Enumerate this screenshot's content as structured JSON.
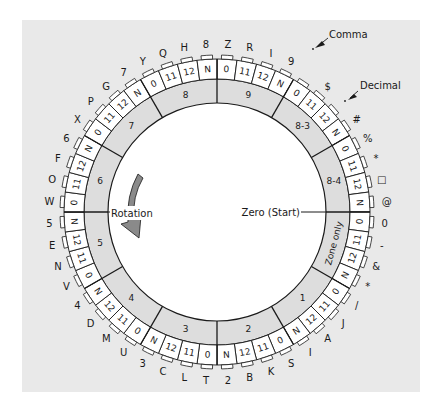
{
  "diagram": {
    "rotation_label": "Rotation",
    "zero_label": "Zero (Start)",
    "annotations": {
      "comma": "Comma",
      "decimal": "Decimal"
    },
    "colors": {
      "background": "#e9e9e9",
      "ring_fill": "#ffffff",
      "annulus_fill": "#dddddd",
      "stroke": "#1a1a1a",
      "arrow": "#8a8a8a"
    },
    "sectors": [
      {
        "label": "9"
      },
      {
        "label": "8-3"
      },
      {
        "label": "8-4"
      },
      {
        "label": "Zone only"
      },
      {
        "label": "1"
      },
      {
        "label": "2"
      },
      {
        "label": "3"
      },
      {
        "label": "4"
      },
      {
        "label": "5"
      },
      {
        "label": "6"
      },
      {
        "label": "7"
      },
      {
        "label": "8"
      }
    ],
    "cells": [
      {
        "code": "0",
        "char": "Z"
      },
      {
        "code": "11",
        "char": "R"
      },
      {
        "code": "12",
        "char": "I"
      },
      {
        "code": "N",
        "char": "9"
      },
      {
        "code": "0",
        "char": ","
      },
      {
        "code": "11",
        "char": "$"
      },
      {
        "code": "12",
        "char": "."
      },
      {
        "code": "N",
        "char": "#"
      },
      {
        "code": "0",
        "char": "%"
      },
      {
        "code": "11",
        "char": "*"
      },
      {
        "code": "12",
        "char": "□"
      },
      {
        "code": "N",
        "char": "@"
      },
      {
        "code": "0",
        "char": "0"
      },
      {
        "code": "11",
        "char": "-"
      },
      {
        "code": "12",
        "char": "&"
      },
      {
        "code": "N",
        "char": "*"
      },
      {
        "code": "0",
        "char": "/"
      },
      {
        "code": "11",
        "char": "J"
      },
      {
        "code": "12",
        "char": "A"
      },
      {
        "code": "N",
        "char": "I"
      },
      {
        "code": "0",
        "char": "S"
      },
      {
        "code": "11",
        "char": "K"
      },
      {
        "code": "12",
        "char": "B"
      },
      {
        "code": "N",
        "char": "2"
      },
      {
        "code": "0",
        "char": "T"
      },
      {
        "code": "11",
        "char": "L"
      },
      {
        "code": "12",
        "char": "C"
      },
      {
        "code": "N",
        "char": "3"
      },
      {
        "code": "0",
        "char": "U"
      },
      {
        "code": "11",
        "char": "M"
      },
      {
        "code": "12",
        "char": "D"
      },
      {
        "code": "N",
        "char": "4"
      },
      {
        "code": "0",
        "char": "V"
      },
      {
        "code": "11",
        "char": "N"
      },
      {
        "code": "12",
        "char": "E"
      },
      {
        "code": "N",
        "char": "5"
      },
      {
        "code": "0",
        "char": "W"
      },
      {
        "code": "11",
        "char": "O"
      },
      {
        "code": "12",
        "char": "F"
      },
      {
        "code": "N",
        "char": "6"
      },
      {
        "code": "0",
        "char": "X"
      },
      {
        "code": "11",
        "char": "P"
      },
      {
        "code": "12",
        "char": "G"
      },
      {
        "code": "N",
        "char": "7"
      },
      {
        "code": "0",
        "char": "Y"
      },
      {
        "code": "11",
        "char": "Q"
      },
      {
        "code": "12",
        "char": "H"
      },
      {
        "code": "N",
        "char": "8"
      }
    ]
  }
}
